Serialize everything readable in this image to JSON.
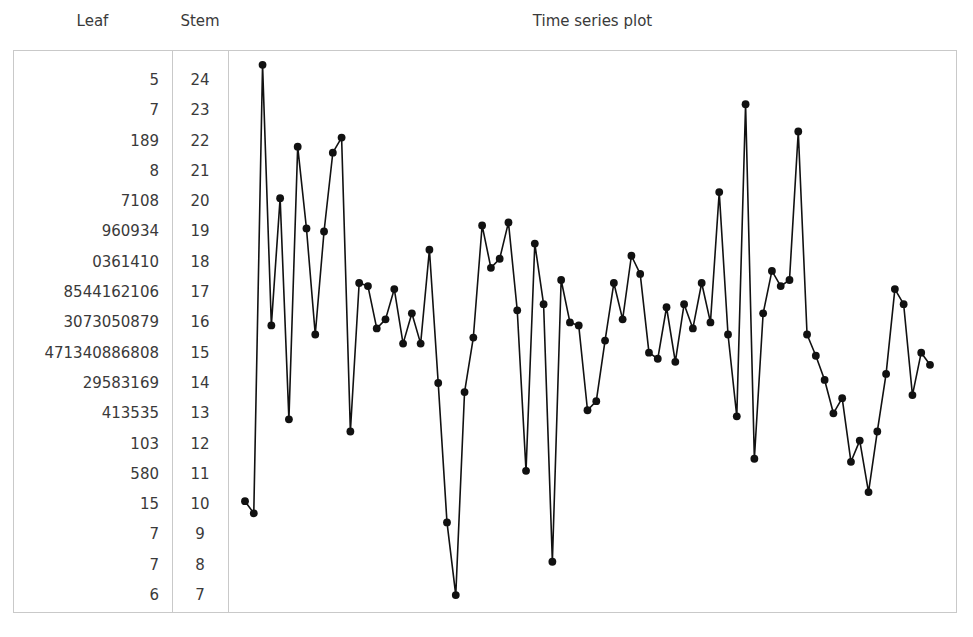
{
  "columns": {
    "leaf_header": "Leaf",
    "stem_header": "Stem",
    "plot_header": "Time series plot"
  },
  "stemplot": {
    "rows": [
      {
        "leaf": "5",
        "stem": "24"
      },
      {
        "leaf": "7",
        "stem": "23"
      },
      {
        "leaf": "189",
        "stem": "22"
      },
      {
        "leaf": "8",
        "stem": "21"
      },
      {
        "leaf": "7108",
        "stem": "20"
      },
      {
        "leaf": "960934",
        "stem": "19"
      },
      {
        "leaf": "0361410",
        "stem": "18"
      },
      {
        "leaf": "8544162106",
        "stem": "17"
      },
      {
        "leaf": "3073050879",
        "stem": "16"
      },
      {
        "leaf": "471340886808",
        "stem": "15"
      },
      {
        "leaf": "29583169",
        "stem": "14"
      },
      {
        "leaf": "413535",
        "stem": "13"
      },
      {
        "leaf": "103",
        "stem": "12"
      },
      {
        "leaf": "580",
        "stem": "11"
      },
      {
        "leaf": "15",
        "stem": "10"
      },
      {
        "leaf": "7",
        "stem": "9"
      },
      {
        "leaf": "7",
        "stem": "8"
      },
      {
        "leaf": "6",
        "stem": "7"
      }
    ]
  },
  "chart_data": {
    "type": "line",
    "title": "Time series plot",
    "xlabel": "",
    "ylabel": "",
    "grid": false,
    "legend": "none",
    "marker": "filled-circle",
    "line_color": "#111111",
    "marker_color": "#111111",
    "ylim": [
      7,
      24.5
    ],
    "xlim": [
      1,
      79
    ],
    "x": [
      1,
      2,
      3,
      4,
      5,
      6,
      7,
      8,
      9,
      10,
      11,
      12,
      13,
      14,
      15,
      16,
      17,
      18,
      19,
      20,
      21,
      22,
      23,
      24,
      25,
      26,
      27,
      28,
      29,
      30,
      31,
      32,
      33,
      34,
      35,
      36,
      37,
      38,
      39,
      40,
      41,
      42,
      43,
      44,
      45,
      46,
      47,
      48,
      49,
      50,
      51,
      52,
      53,
      54,
      55,
      56,
      57,
      58,
      59,
      60,
      61,
      62,
      63,
      64,
      65,
      66,
      67,
      68,
      69,
      70,
      71,
      72,
      73,
      74,
      75,
      76,
      77,
      78,
      79
    ],
    "values": [
      10.1,
      9.7,
      24.5,
      15.9,
      20.1,
      12.8,
      21.8,
      19.1,
      15.6,
      19.0,
      21.6,
      22.1,
      12.4,
      17.3,
      17.2,
      15.8,
      16.1,
      17.1,
      15.3,
      16.3,
      15.3,
      18.4,
      14.0,
      9.4,
      7.0,
      13.7,
      15.5,
      19.2,
      17.8,
      18.1,
      19.3,
      16.4,
      11.1,
      18.6,
      16.6,
      8.1,
      17.4,
      16.0,
      15.9,
      13.1,
      13.4,
      15.4,
      17.3,
      16.1,
      18.2,
      17.6,
      15.0,
      14.8,
      16.5,
      14.7,
      16.6,
      15.8,
      17.3,
      16.0,
      20.3,
      15.6,
      12.9,
      23.2,
      11.5,
      16.3,
      17.7,
      17.2,
      17.4,
      22.3,
      15.6,
      14.9,
      14.1,
      13.0,
      13.5,
      11.4,
      12.1,
      10.4,
      12.4,
      14.3,
      17.1,
      16.6,
      13.6,
      15.0,
      14.6
    ]
  }
}
